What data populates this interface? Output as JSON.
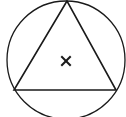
{
  "diagram": {
    "stroke_color": "#1a1a1a",
    "background": "#ffffff",
    "circle": {
      "cx": 66,
      "cy": 60,
      "r": 59
    },
    "triangle": {
      "points": "67,1 14,90 116,90"
    },
    "center_mark": {
      "x": 66,
      "y": 61,
      "glyph": "x"
    }
  }
}
